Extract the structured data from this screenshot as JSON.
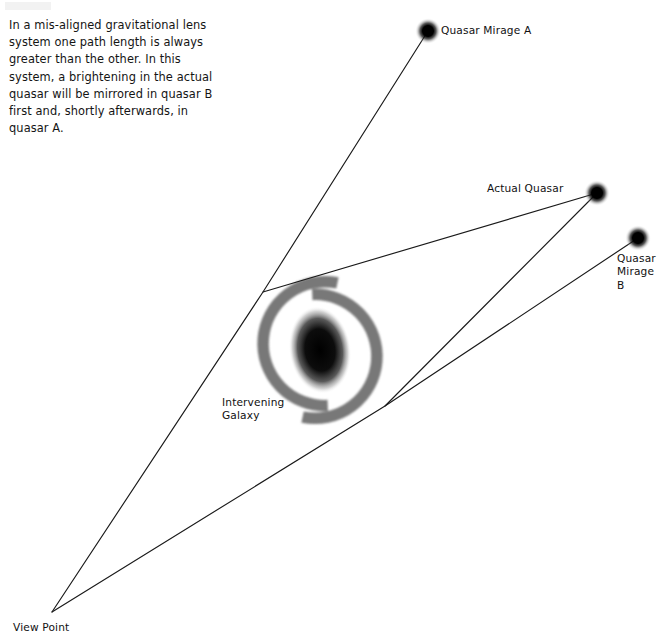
{
  "figure": {
    "name": "gravitational-lens-diagram",
    "caption": "In a mis-aligned gravitational lens system one path length is always greater than the other.  In this system, a brightening in the actual quasar will be mirrored in quasar B first and, shortly afterwards, in quasar A.",
    "background_color": "#ffffff",
    "line_color": "#1a1a1a",
    "galaxy_arm_color": "#787878",
    "galaxy_core_color": "#0a0a0a",
    "quasar_color": "#000000"
  },
  "labels": {
    "quasar_mirage_a": "Quasar Mirage A",
    "actual_quasar": "Actual Quasar",
    "quasar_mirage_b": "Quasar\nMirage\nB",
    "intervening_galaxy": "Intervening\nGalaxy",
    "view_point": "View Point"
  },
  "objects": {
    "quasar_mirage_a": {
      "name": "Quasar Mirage A",
      "x": 428,
      "y": 31,
      "radius": 8
    },
    "actual_quasar": {
      "name": "Actual Quasar",
      "x": 597,
      "y": 193,
      "radius": 8
    },
    "quasar_mirage_b": {
      "name": "Quasar Mirage B",
      "x": 638,
      "y": 238,
      "radius": 8
    },
    "view_point": {
      "name": "View Point",
      "x": 52,
      "y": 612
    },
    "lens_bend_upper": {
      "name": "upper deflection point",
      "x": 263,
      "y": 292
    },
    "lens_bend_lower": {
      "name": "lower deflection point",
      "x": 385,
      "y": 406
    },
    "galaxy": {
      "name": "Intervening Galaxy",
      "x": 320,
      "y": 350
    }
  },
  "light_paths": [
    {
      "name": "apparent-path-to-mirage-a",
      "from": "view_point",
      "via": "lens_bend_upper",
      "to": "quasar_mirage_a"
    },
    {
      "name": "true-path-upper",
      "from": "lens_bend_upper",
      "to": "actual_quasar"
    },
    {
      "name": "apparent-path-to-mirage-b",
      "from": "view_point",
      "via": "lens_bend_lower",
      "to": "quasar_mirage_b"
    },
    {
      "name": "true-path-lower",
      "from": "lens_bend_lower",
      "to": "actual_quasar"
    }
  ]
}
